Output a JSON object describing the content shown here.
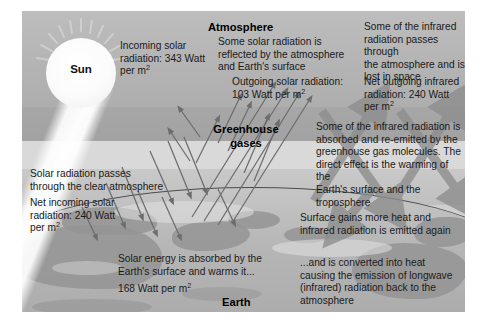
{
  "diagram": {
    "labels": {
      "sun": "Sun",
      "atmosphere": "Atmosphere",
      "greenhouse_gases_line1": "Greenhouse",
      "greenhouse_gases_line2": "gases",
      "earth": "Earth"
    },
    "annotations": {
      "incoming_solar": "Incoming solar\nradiation: 343 Watt\nper m",
      "incoming_solar_unit": "2",
      "reflected": "Some solar radiation is\nreflected by the atmosphere\nand Earth's surface",
      "outgoing_solar": "Outgoing solar radiation:\n103 Watt per m",
      "outgoing_solar_unit": "2",
      "ir_passes": "Some of the infrared\nradiation passes through\nthe atmosphere and is\nlost in space",
      "net_outgoing_ir": "Net outgoing infrared\nradiation: 240 Watt per m",
      "net_outgoing_ir_unit": "2",
      "absorbed_reemitted": "Some of the infrared radiation is\nabsorbed and re-emitted by the\ngreenhouse gas molecules. The\ndirect effect is the warming of the\nEarth's surface and the troposphere",
      "passes_clear": "Solar radiation passes\nthrough the clear atmosphere",
      "net_incoming_solar": "Net incoming solar\nradiation: 240 Watt\nper m",
      "net_incoming_solar_unit": "2",
      "surface_gains": "Surface gains more heat and\ninfrared radiation is emitted again",
      "absorbed_by_surface": "Solar energy is absorbed by the\nEarth's surface and warms it...",
      "absorbed_value": "168 Watt per m",
      "absorbed_value_unit": "2",
      "converted_to_heat": "...and is converted into heat\ncausing the emission of longwave\n(infrared) radiation back to the\natmosphere"
    },
    "values": {
      "incoming_solar_radiation_w_m2": 343,
      "outgoing_solar_radiation_w_m2": 103,
      "net_incoming_solar_radiation_w_m2": 240,
      "net_outgoing_infrared_radiation_w_m2": 240,
      "absorbed_by_surface_w_m2": 168
    },
    "colors": {
      "space": "#bdbdbd",
      "atmosphere_mid": "#d9d9d9",
      "earth": "#b6b6b6",
      "land": "#949494",
      "thin_arrow": "#6d6d6d",
      "thick_arrow": "#8d8d8d",
      "text": "#1a1a1a",
      "sun": "#ffffff",
      "frame": "#ffffff"
    }
  }
}
